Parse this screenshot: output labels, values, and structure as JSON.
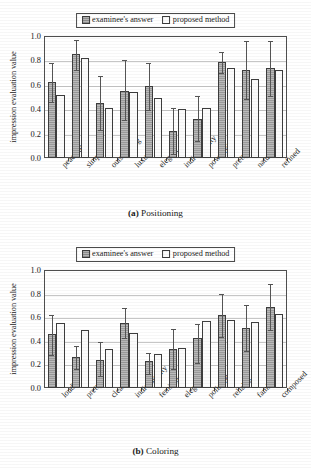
{
  "figure": {
    "legend": {
      "series_a_label": "examinee's answer",
      "series_b_label": "proposed method",
      "swatch_a": "filled-square-icon",
      "swatch_b": "open-square-icon"
    },
    "panels": [
      {
        "caption_prefix": "(a)",
        "caption_text": "Positioning",
        "chart_data": {
          "type": "bar",
          "title": "(a) Positioning",
          "xlabel": "",
          "ylabel": "impression evaluation value",
          "ylim": [
            0.0,
            1.0
          ],
          "yticks": [
            "0.0",
            "0.2",
            "0.4",
            "0.6",
            "0.8",
            "1.0"
          ],
          "ytick_values": [
            0.0,
            0.2,
            0.4,
            0.6,
            0.8,
            1.0
          ],
          "grid": true,
          "legend_position": "above-center",
          "categories": [
            "peaceful",
            "simple",
            "outstanding",
            "luxury",
            "elegant",
            "individuality",
            "powerful",
            "pretty",
            "natural",
            "refined"
          ],
          "series": [
            {
              "name": "examinee's answer",
              "values": [
                0.62,
                0.85,
                0.45,
                0.55,
                0.59,
                0.22,
                0.32,
                0.79,
                0.72,
                0.74
              ],
              "err_low": [
                0.46,
                0.72,
                0.23,
                0.31,
                0.39,
                0.03,
                0.14,
                0.7,
                0.48,
                0.51
              ],
              "err_high": [
                0.78,
                0.97,
                0.67,
                0.8,
                0.78,
                0.41,
                0.51,
                0.87,
                0.96,
                0.96
              ]
            },
            {
              "name": "proposed method",
              "values": [
                0.52,
                0.82,
                0.41,
                0.54,
                0.49,
                0.4,
                0.41,
                0.74,
                0.65,
                0.72
              ],
              "err_low": [],
              "err_high": []
            }
          ]
        }
      },
      {
        "caption_prefix": "(b)",
        "caption_text": "Coloring",
        "chart_data": {
          "type": "bar",
          "title": "(b) Coloring",
          "xlabel": "",
          "ylabel": "impression evaluation value",
          "ylim": [
            0.0,
            1.0
          ],
          "yticks": [
            "0.0",
            "0.2",
            "0.4",
            "0.6",
            "0.8",
            "1.0"
          ],
          "ytick_values": [
            0.0,
            0.2,
            0.4,
            0.6,
            0.8,
            1.0
          ],
          "grid": true,
          "legend_position": "above-center",
          "categories": [
            "loudly",
            "pretty",
            "clear",
            "individuality",
            "feminine",
            "elegant",
            "polished",
            "reliable",
            "familiar",
            "composed"
          ],
          "series": [
            {
              "name": "examinee's answer",
              "values": [
                0.46,
                0.26,
                0.24,
                0.55,
                0.23,
                0.33,
                0.42,
                0.62,
                0.51,
                0.69
              ],
              "err_low": [
                0.28,
                0.16,
                0.1,
                0.42,
                0.12,
                0.16,
                0.21,
                0.43,
                0.31,
                0.49
              ],
              "err_high": [
                0.62,
                0.36,
                0.39,
                0.68,
                0.3,
                0.5,
                0.54,
                0.8,
                0.7,
                0.88
              ]
            },
            {
              "name": "proposed method",
              "values": [
                0.55,
                0.49,
                0.33,
                0.47,
                0.29,
                0.34,
                0.57,
                0.58,
                0.56,
                0.63
              ],
              "err_low": [],
              "err_high": []
            }
          ]
        }
      }
    ]
  }
}
